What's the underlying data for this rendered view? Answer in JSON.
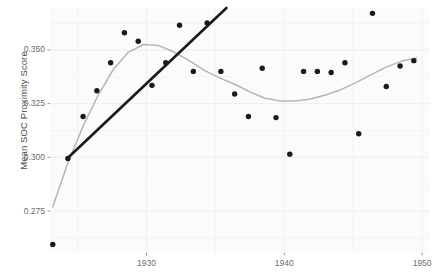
{
  "chart_data": {
    "type": "scatter",
    "title": "",
    "xlabel": "",
    "ylabel": "Mean SOC Proximity Score",
    "xlim": [
      1923.0,
      1950.5
    ],
    "ylim": [
      0.2555,
      0.3695
    ],
    "grid": true,
    "legend": false,
    "x_ticks": [
      1930,
      1940,
      1950
    ],
    "x_tick_labels": [
      "1930",
      "1940",
      "1950"
    ],
    "y_ticks": [
      0.275,
      0.3,
      0.325,
      0.35
    ],
    "y_tick_labels": [
      "0.275",
      "0.300",
      "0.325",
      "0.350"
    ],
    "series": [
      {
        "name": "Mean SOC Proximity Score",
        "type": "scatter",
        "marker": "circle",
        "color": "#1a1a1a",
        "x": [
          1923.2,
          1924.3,
          1925.4,
          1926.4,
          1927.4,
          1928.4,
          1929.4,
          1930.4,
          1931.4,
          1932.4,
          1933.4,
          1934.4,
          1935.4,
          1936.4,
          1937.4,
          1938.4,
          1939.4,
          1940.4,
          1941.4,
          1942.4,
          1943.4,
          1944.4,
          1945.4,
          1946.4,
          1947.4,
          1948.4,
          1949.4
        ],
        "y": [
          0.2595,
          0.2995,
          0.319,
          0.331,
          0.344,
          0.358,
          0.354,
          0.3335,
          0.344,
          0.3615,
          0.34,
          0.3625,
          0.34,
          0.3295,
          0.319,
          0.3415,
          0.3185,
          0.3015,
          0.34,
          0.34,
          0.3395,
          0.344,
          0.311,
          0.367,
          0.333,
          0.3425,
          0.345
        ]
      },
      {
        "name": "linear-trend",
        "type": "line",
        "color": "#1a1a1a",
        "x": [
          1924.25,
          1935.8
        ],
        "y": [
          0.2995,
          0.3695
        ]
      },
      {
        "name": "loess-smooth",
        "type": "line",
        "color": "#b3b3b3",
        "x": [
          1923.2,
          1924.3,
          1925.4,
          1926.5,
          1927.6,
          1928.7,
          1929.8,
          1930.9,
          1932.0,
          1933.1,
          1934.2,
          1935.3,
          1936.4,
          1937.5,
          1938.6,
          1939.7,
          1940.8,
          1941.9,
          1943.0,
          1944.1,
          1945.2,
          1946.3,
          1947.4,
          1948.5,
          1949.6
        ],
        "y": [
          0.277,
          0.2975,
          0.3145,
          0.329,
          0.341,
          0.349,
          0.3525,
          0.352,
          0.349,
          0.345,
          0.3405,
          0.337,
          0.334,
          0.3305,
          0.3275,
          0.3262,
          0.3262,
          0.3272,
          0.329,
          0.3315,
          0.3348,
          0.3385,
          0.342,
          0.3448,
          0.3462
        ]
      }
    ]
  },
  "axis": {
    "y_title": "Mean SOC Proximity Score"
  },
  "style": {
    "panel_background": "#fbfbfb",
    "grid_color": "#efefef",
    "point_color": "#1a1a1a",
    "trend_color": "#1a1a1a",
    "smooth_color": "#b5b5b5",
    "tick_text_color": "#6b6b6b",
    "axis_title_color": "#4d4d4d"
  }
}
